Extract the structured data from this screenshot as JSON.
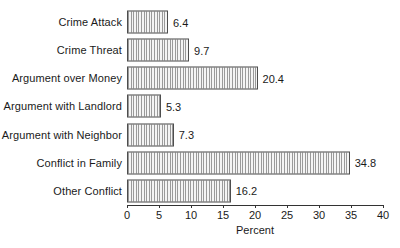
{
  "chart_data": {
    "type": "bar",
    "orientation": "horizontal",
    "title": "",
    "subtitle": "",
    "xlabel": "Percent",
    "ylabel": "",
    "xlim": [
      0,
      40
    ],
    "xticks": [
      0,
      5,
      10,
      15,
      20,
      25,
      30,
      35,
      40
    ],
    "xtick_labels": [
      "0",
      "5",
      "10",
      "15",
      "20",
      "25",
      "30",
      "35",
      "40"
    ],
    "grid": false,
    "legend": null,
    "categories": [
      "Crime Attack",
      "Crime Threat",
      "Argument over Money",
      "Argument with Landlord",
      "Argument with Neighbor",
      "Conflict in Family",
      "Other Conflict"
    ],
    "values": [
      6.4,
      9.7,
      20.4,
      5.3,
      7.3,
      34.8,
      16.2
    ],
    "value_labels": [
      "6.4",
      "9.7",
      "20.4",
      "5.3",
      "7.3",
      "34.8",
      "16.2"
    ],
    "bar_style": {
      "fill": "#f2f2f2",
      "hatch": "vertical-lines",
      "hatch_color": "#9a9a9a",
      "border_color": "#4d4d4d"
    },
    "axis_color": "#333333",
    "text_color": "#1a1a1a",
    "background": "#ffffff"
  }
}
